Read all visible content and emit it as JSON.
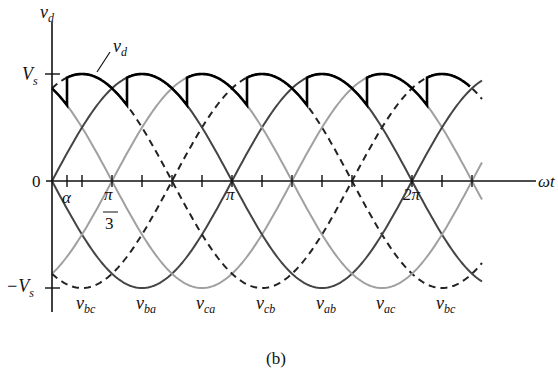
{
  "figure": {
    "caption": "(b)",
    "y_axis_label": "v",
    "y_axis_label_sub": "d",
    "x_axis_label": "ωt",
    "origin_label": "0",
    "vs_label": "V",
    "vs_sub": "s",
    "neg_vs_label": "−V",
    "neg_vs_sub": "s",
    "alpha_label": "α",
    "pi3_num": "π",
    "pi3_den": "3",
    "pi_label": "π",
    "two_pi_label": "2π",
    "vd_annot": "v",
    "vd_annot_sub": "d"
  },
  "chart_data": {
    "type": "line",
    "xlabel": "ωt",
    "ylabel": "v_d",
    "x_ticks_deg": [
      0,
      15,
      30,
      60,
      90,
      120,
      150,
      180,
      210,
      240,
      270,
      300,
      330,
      360,
      390,
      420
    ],
    "x_tick_labels": {
      "15": "α",
      "60": "π/3",
      "180": "π",
      "360": "2π"
    },
    "y_ticks": {
      "1": "V_s",
      "0": "0",
      "-1": "−V_s"
    },
    "alpha_deg": 15,
    "x_range_deg": [
      0,
      430
    ],
    "amplitude": 1,
    "series": [
      {
        "name": "v_bc",
        "style": "dashed",
        "color": "#222222",
        "trough_deg": 30
      },
      {
        "name": "v_ba",
        "style": "solid",
        "color": "#444444",
        "trough_deg": 90
      },
      {
        "name": "v_ca",
        "style": "solid",
        "color": "#a0a0a0",
        "trough_deg": 150
      },
      {
        "name": "v_cb",
        "style": "dashed",
        "color": "#222222",
        "trough_deg": 210
      },
      {
        "name": "v_ab",
        "style": "solid",
        "color": "#444444",
        "trough_deg": 270
      },
      {
        "name": "v_ac",
        "style": "solid",
        "color": "#a0a0a0",
        "trough_deg": 330
      }
    ],
    "trough_labels": [
      "v_bc",
      "v_ba",
      "v_ca",
      "v_cb",
      "v_ab",
      "v_ac",
      "v_bc"
    ],
    "envelope": {
      "name": "v_d",
      "color": "#000000",
      "start_deg": 0,
      "end_deg": 418
    }
  },
  "trough_labels": [
    {
      "main": "v",
      "sub": "bc"
    },
    {
      "main": "v",
      "sub": "ba"
    },
    {
      "main": "v",
      "sub": "ca"
    },
    {
      "main": "v",
      "sub": "cb"
    },
    {
      "main": "v",
      "sub": "ab"
    },
    {
      "main": "v",
      "sub": "ac"
    },
    {
      "main": "v",
      "sub": "bc"
    }
  ]
}
